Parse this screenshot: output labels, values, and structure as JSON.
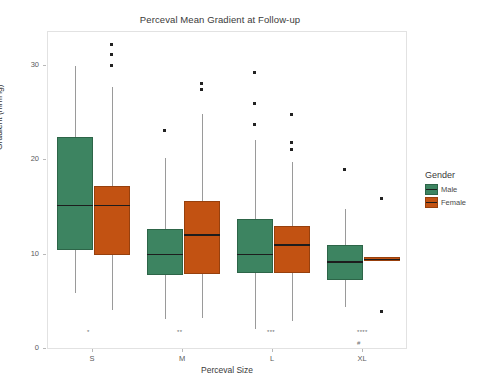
{
  "chart_data": {
    "type": "box",
    "title": "Perceval Mean Gradient at Follow-up",
    "xlabel": "Perceval Size",
    "ylabel": "Gradient (mmHg)",
    "categories": [
      "S",
      "M",
      "L",
      "XL"
    ],
    "ylim": [
      0,
      32.5
    ],
    "yticks": [
      0,
      10,
      20,
      30
    ],
    "ytick_labels": [
      "0",
      "10",
      "20",
      "30"
    ],
    "grid": false,
    "legend": {
      "title": "Gender",
      "position": "right",
      "entries": [
        {
          "label": "Male",
          "color": "#3d8461"
        },
        {
          "label": "Female",
          "color": "#c25212"
        }
      ]
    },
    "series": [
      {
        "name": "Male",
        "color": "#3d8461",
        "boxes": [
          {
            "category": "S",
            "whisker_low": 5.9,
            "q1": 10.5,
            "median": 15.2,
            "q3": 22.5,
            "whisker_high": 30.0,
            "outliers": []
          },
          {
            "category": "M",
            "whisker_low": 3.2,
            "q1": 7.8,
            "median": 10.0,
            "q3": 12.7,
            "whisker_high": 20.2,
            "outliers": [
              23.2
            ]
          },
          {
            "category": "L",
            "whisker_low": 2.1,
            "q1": 8.1,
            "median": 10.0,
            "q3": 13.8,
            "whisker_high": 22.2,
            "outliers": [
              29.3,
              26.0,
              23.8
            ]
          },
          {
            "category": "XL",
            "whisker_low": 4.5,
            "q1": 7.3,
            "median": 9.2,
            "q3": 11.0,
            "whisker_high": 14.8,
            "outliers": [
              19.0
            ]
          }
        ]
      },
      {
        "name": "Female",
        "color": "#c25212",
        "boxes": [
          {
            "category": "S",
            "whisker_low": 4.1,
            "q1": 10.0,
            "median": 15.2,
            "q3": 17.3,
            "whisker_high": 27.8,
            "outliers": [
              32.3,
              31.2,
              30.1
            ]
          },
          {
            "category": "M",
            "whisker_low": 3.3,
            "q1": 7.9,
            "median": 12.1,
            "q3": 15.7,
            "whisker_high": 24.9,
            "outliers": [
              28.1,
              27.5
            ]
          },
          {
            "category": "L",
            "whisker_low": 3.0,
            "q1": 8.1,
            "median": 11.0,
            "q3": 13.0,
            "whisker_high": 19.8,
            "outliers": [
              24.9,
              21.9,
              21.1
            ]
          },
          {
            "category": "XL",
            "whisker_low": 9.3,
            "q1": 9.3,
            "median": 9.5,
            "q3": 9.7,
            "whisker_high": 9.7,
            "outliers": [
              16.0,
              4.0
            ]
          }
        ]
      }
    ],
    "annotations": [
      {
        "text": "*",
        "category": "S",
        "value": 2.1
      },
      {
        "text": "**",
        "category": "M",
        "value": 2.1
      },
      {
        "text": "***",
        "category": "L",
        "value": 2.1
      },
      {
        "text": "****",
        "category": "XL",
        "value": 2.1
      },
      {
        "text": "#",
        "category": "XL",
        "value": 1.0
      }
    ]
  }
}
